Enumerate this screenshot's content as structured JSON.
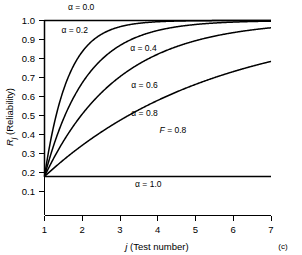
{
  "figure": {
    "panel_label": "(c)",
    "background_color": "#ffffff",
    "line_color": "#000000"
  },
  "chart_data": {
    "type": "line",
    "title": "",
    "xlabel": "j (Test number)",
    "ylabel": "R_j (Reliability)",
    "xlabel_parts": {
      "symbol": "j",
      "rest": " (Test number)"
    },
    "ylabel_parts": {
      "symbol": "R",
      "subscript": "j",
      "rest": " (Reliability)"
    },
    "xlim": [
      1,
      7
    ],
    "ylim": [
      0.0,
      1.0
    ],
    "xticks": [
      1,
      2,
      3,
      4,
      5,
      6,
      7
    ],
    "xtick_labels": [
      "1",
      "2",
      "3",
      "4",
      "5",
      "6",
      "7"
    ],
    "yticks": [
      0.1,
      0.2,
      0.3,
      0.4,
      0.5,
      0.6,
      0.7,
      0.8,
      0.9,
      1.0
    ],
    "ytick_labels": [
      "0.1",
      "0.2",
      "0.3",
      "0.4",
      "0.5",
      "0.6",
      "0.7",
      "0.8",
      "0.9",
      "1.0"
    ],
    "y_axis_visible_range": [
      0.0,
      1.0
    ],
    "grid": false,
    "legend_position": "inline-annotations",
    "formula": "R_j = 1 - F * alpha^(j-1)",
    "parameter_F": 0.8,
    "annotations": [
      {
        "text": "F = 0.8",
        "symbol": "F",
        "rest": " = 0.8",
        "x": 4.05,
        "y": 0.425
      }
    ],
    "x": [
      1,
      2,
      3,
      4,
      5,
      6,
      7
    ],
    "series": [
      {
        "name": "α = 0.0",
        "alpha": 0.0,
        "label": "α = 0.0",
        "label_x": 1.62,
        "label_y": 1.055,
        "values": [
          0.2,
          1.0,
          1.0,
          1.0,
          1.0,
          1.0,
          1.0
        ]
      },
      {
        "name": "α = 0.2",
        "alpha": 0.2,
        "label": "α = 0.2",
        "label_x": 1.45,
        "label_y": 0.935,
        "values": [
          0.2,
          0.84,
          0.968,
          0.9936,
          0.99872,
          0.999744,
          0.9999488
        ]
      },
      {
        "name": "α = 0.4",
        "alpha": 0.4,
        "label": "α = 0.4",
        "label_x": 3.27,
        "label_y": 0.845,
        "values": [
          0.2,
          0.68,
          0.872,
          0.9488,
          0.97952,
          0.991808,
          0.9967232
        ]
      },
      {
        "name": "α = 0.6",
        "alpha": 0.6,
        "label": "α = 0.6",
        "label_x": 3.3,
        "label_y": 0.655,
        "values": [
          0.2,
          0.52,
          0.712,
          0.8272,
          0.89632,
          0.937792,
          0.9626752
        ]
      },
      {
        "name": "α = 0.8",
        "alpha": 0.8,
        "label": "α = 0.8",
        "label_x": 3.3,
        "label_y": 0.508,
        "values": [
          0.2,
          0.36,
          0.488,
          0.5904,
          0.67232,
          0.737856,
          0.7902848
        ]
      },
      {
        "name": "α = 1.0",
        "alpha": 1.0,
        "label": "α = 1.0",
        "label_x": 3.4,
        "label_y": 0.145,
        "values": [
          0.2,
          0.2,
          0.2,
          0.2,
          0.2,
          0.2,
          0.2
        ]
      }
    ]
  }
}
